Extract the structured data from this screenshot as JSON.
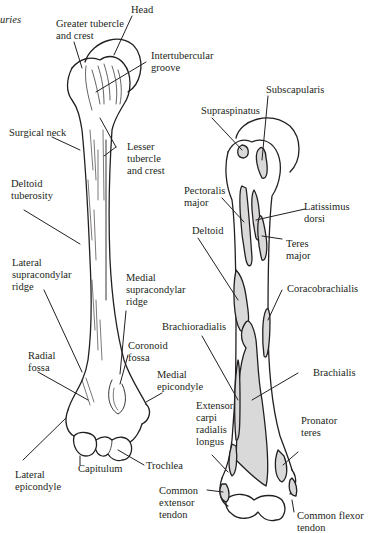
{
  "header": {
    "cropped_caption": "uries"
  },
  "colors": {
    "ink": "#231f20",
    "muscle_fill": "#d9d9d9",
    "background": "#ffffff"
  },
  "left_figure": {
    "title": "Anterior humerus bony landmarks",
    "labels": [
      {
        "id": "head",
        "lines": [
          "Head"
        ]
      },
      {
        "id": "greater-tubercle",
        "lines": [
          "Greater tubercle",
          "and crest"
        ]
      },
      {
        "id": "intertubercular-groove",
        "lines": [
          "Intertubercular",
          "groove"
        ]
      },
      {
        "id": "surgical-neck",
        "lines": [
          "Surgical neck"
        ]
      },
      {
        "id": "lesser-tubercle",
        "lines": [
          "Lesser",
          "tubercle",
          "and crest"
        ]
      },
      {
        "id": "deltoid-tuberosity",
        "lines": [
          "Deltoid",
          "tuberosity"
        ]
      },
      {
        "id": "lateral-supracondylar-ridge",
        "lines": [
          "Lateral",
          "supracondylar",
          "ridge"
        ]
      },
      {
        "id": "medial-supracondylar-ridge",
        "lines": [
          "Medial",
          "supracondylar",
          "ridge"
        ]
      },
      {
        "id": "coronoid-fossa",
        "lines": [
          "Coronoid",
          "fossa"
        ]
      },
      {
        "id": "radial-fossa",
        "lines": [
          "Radial",
          "fossa"
        ]
      },
      {
        "id": "medial-epicondyle",
        "lines": [
          "Medial",
          "epicondyle"
        ]
      },
      {
        "id": "trochlea",
        "lines": [
          "Trochlea"
        ]
      },
      {
        "id": "capitulum",
        "lines": [
          "Capitulum"
        ]
      },
      {
        "id": "lateral-epicondyle",
        "lines": [
          "Lateral",
          "epicondyle"
        ]
      }
    ]
  },
  "right_figure": {
    "title": "Anterior humerus muscle attachments",
    "labels": [
      {
        "id": "subscapularis",
        "lines": [
          "Subscapularis"
        ]
      },
      {
        "id": "supraspinatus",
        "lines": [
          "Supraspinatus"
        ]
      },
      {
        "id": "pectoralis-major",
        "lines": [
          "Pectoralis",
          "major"
        ]
      },
      {
        "id": "latissimus-dorsi",
        "lines": [
          "Latissimus",
          "dorsi"
        ]
      },
      {
        "id": "deltoid",
        "lines": [
          "Deltoid"
        ]
      },
      {
        "id": "teres-major",
        "lines": [
          "Teres",
          "major"
        ]
      },
      {
        "id": "coracobrachialis",
        "lines": [
          "Coracobrachialis"
        ]
      },
      {
        "id": "brachioradialis",
        "lines": [
          "Brachioradialis"
        ]
      },
      {
        "id": "brachialis",
        "lines": [
          "Brachialis"
        ]
      },
      {
        "id": "extensor-carpi-radialis-longus",
        "lines": [
          "Extensor",
          "carpi",
          "radialis",
          "longus"
        ]
      },
      {
        "id": "pronator-teres",
        "lines": [
          "Pronator",
          "teres"
        ]
      },
      {
        "id": "common-extensor-tendon",
        "lines": [
          "Common",
          "extensor",
          "tendon"
        ]
      },
      {
        "id": "common-flexor-tendon",
        "lines": [
          "Common flexor",
          "tendon"
        ]
      }
    ]
  }
}
